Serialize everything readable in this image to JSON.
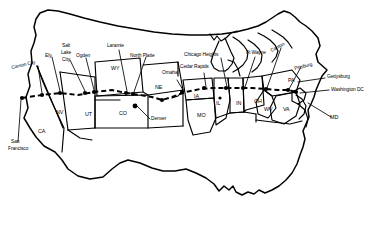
{
  "figure": {
    "kind": "map",
    "region": "Continental United States",
    "style": "black-and-white line art outline map",
    "stroke_color": "#000000",
    "background_color": "#ffffff",
    "route_style": "dashed line with filled circular waypoint markers"
  },
  "route": {
    "name": "transcontinental route",
    "origin": "San Francisco",
    "destination": "Washington DC",
    "waypoints": [
      "San Francisco",
      "Carson City",
      "Ely",
      "Salt Lake City",
      "Ogden",
      "Laramie",
      "North Platte",
      "Omaha",
      "Cedar Rapids",
      "Chicago Heights",
      "Ft Wayne",
      "Canton",
      "Pittsburg",
      "Gettysburg",
      "Washington DC"
    ]
  },
  "city_labels": [
    {
      "id": "san-francisco",
      "line1": "San",
      "line2": "Francisco"
    },
    {
      "id": "carson-city",
      "line1": "Carson City",
      "line2": ""
    },
    {
      "id": "ely",
      "line1": "Ely",
      "line2": ""
    },
    {
      "id": "salt-lake-city",
      "line1": "Salt",
      "line2": "Lake",
      "line3": "City"
    },
    {
      "id": "ogden",
      "line1": "Ogden",
      "line2": ""
    },
    {
      "id": "laramie",
      "line1": "Laramie",
      "line2": ""
    },
    {
      "id": "north-platte",
      "line1": "North Platte",
      "line2": ""
    },
    {
      "id": "omaha",
      "line1": "Omaha",
      "line2": ""
    },
    {
      "id": "denver",
      "line1": "Denver",
      "line2": ""
    },
    {
      "id": "cedar-rapids",
      "line1": "Cedar Rapids",
      "line2": ""
    },
    {
      "id": "chicago-heights",
      "line1": "Chicago Heights",
      "line2": ""
    },
    {
      "id": "ft-wayne",
      "line1": "Ft Wayne",
      "line2": ""
    },
    {
      "id": "canton",
      "line1": "Canton",
      "line2": ""
    },
    {
      "id": "pittsburg",
      "line1": "Pittsburg",
      "line2": ""
    },
    {
      "id": "gettysburg",
      "line1": "Gettysburg",
      "line2": ""
    },
    {
      "id": "washington-dc",
      "line1": "Washington DC",
      "line2": ""
    }
  ],
  "state_labels": [
    {
      "id": "ca",
      "text": "CA"
    },
    {
      "id": "nv",
      "text": "NV"
    },
    {
      "id": "ut",
      "text": "UT"
    },
    {
      "id": "wy",
      "text": "WY"
    },
    {
      "id": "co",
      "text": "CO"
    },
    {
      "id": "ne",
      "text": "NE"
    },
    {
      "id": "ia",
      "text": "IA"
    },
    {
      "id": "mo",
      "text": "MO"
    },
    {
      "id": "il",
      "text": "IL"
    },
    {
      "id": "in",
      "text": "IN"
    },
    {
      "id": "oh",
      "text": "OH"
    },
    {
      "id": "wv",
      "text": "WV"
    },
    {
      "id": "va",
      "text": "VA"
    },
    {
      "id": "pa",
      "text": "PA"
    },
    {
      "id": "md",
      "text": "MD"
    }
  ],
  "cities": {
    "san_francisco": "San",
    "san_francisco2": "Francisco",
    "carson_city": "Carson City",
    "ely": "Ely",
    "slc1": "Salt",
    "slc2": "Lake",
    "slc3": "City",
    "ogden": "Ogden",
    "laramie": "Laramie",
    "north_platte": "North Platte",
    "omaha": "Omaha",
    "denver": "Denver",
    "cedar_rapids": "Cedar Rapids",
    "chicago_heights": "Chicago Heights",
    "ft_wayne": "Ft Wayne",
    "canton": "Canton",
    "pittsburg": "Pittsburg",
    "gettysburg": "Gettysburg",
    "washington_dc": "Washington DC"
  },
  "states": {
    "ca": "CA",
    "nv": "NV",
    "ut": "UT",
    "wy": "WY",
    "co": "CO",
    "ne": "NE",
    "ia": "IA",
    "mo": "MO",
    "il": "IL",
    "in": "IN",
    "oh": "OH",
    "wv": "WV",
    "va": "VA",
    "pa": "PA",
    "md": "MD"
  }
}
